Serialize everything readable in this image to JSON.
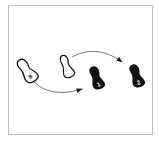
{
  "diagram": {
    "type": "footwork-step-diagram",
    "footprints": [
      {
        "id": "start",
        "fill": "outline",
        "label": "8"
      },
      {
        "id": "other-foot",
        "fill": "outline",
        "label": ""
      },
      {
        "id": "step-1",
        "fill": "solid",
        "label": "1"
      },
      {
        "id": "step-2",
        "fill": "solid",
        "label": "2"
      }
    ],
    "arrows": [
      {
        "from": "start",
        "to": "step-1"
      },
      {
        "from": "other-foot",
        "to": "step-2"
      }
    ],
    "colors": {
      "ink": "#111111",
      "frame": "#bdbdbd",
      "arrow": "#555555"
    }
  }
}
